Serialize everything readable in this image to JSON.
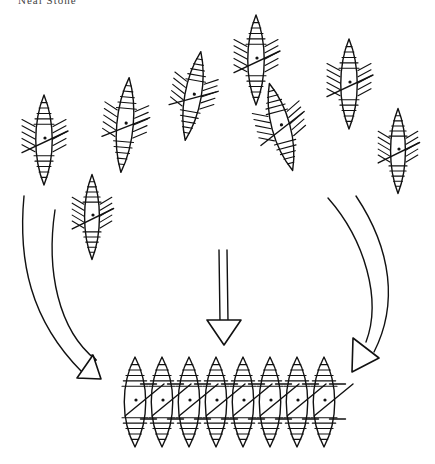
{
  "figure": {
    "header_text": "Neal Stone",
    "stroke_color": "#111111",
    "background": "#ffffff"
  },
  "scattered_cells": [
    {
      "id": "cell-1",
      "cx": 44,
      "cy": 140,
      "len": 90,
      "w": 20,
      "tilt": 0
    },
    {
      "id": "cell-2",
      "cx": 125,
      "cy": 125,
      "len": 95,
      "w": 20,
      "tilt": 5
    },
    {
      "id": "cell-3",
      "cx": 92,
      "cy": 217,
      "len": 85,
      "w": 18,
      "tilt": 0
    },
    {
      "id": "cell-4",
      "cx": 193,
      "cy": 96,
      "len": 90,
      "w": 20,
      "tilt": 10
    },
    {
      "id": "cell-5",
      "cx": 256,
      "cy": 60,
      "len": 90,
      "w": 20,
      "tilt": 0
    },
    {
      "id": "cell-6",
      "cx": 281,
      "cy": 127,
      "len": 90,
      "w": 22,
      "tilt": -15
    },
    {
      "id": "cell-7",
      "cx": 349,
      "cy": 84,
      "len": 90,
      "w": 20,
      "tilt": 0
    },
    {
      "id": "cell-8",
      "cx": 398,
      "cy": 151,
      "len": 85,
      "w": 18,
      "tilt": 0
    }
  ],
  "aligned_chain": {
    "count": 8,
    "start_x": 135,
    "spacing": 27,
    "cy": 402,
    "len": 90,
    "w": 26
  },
  "arrows": [
    {
      "id": "left-curved-arrow",
      "direction": "down-right"
    },
    {
      "id": "center-straight-arrow",
      "direction": "down"
    },
    {
      "id": "right-curved-arrow",
      "direction": "down-left"
    }
  ]
}
